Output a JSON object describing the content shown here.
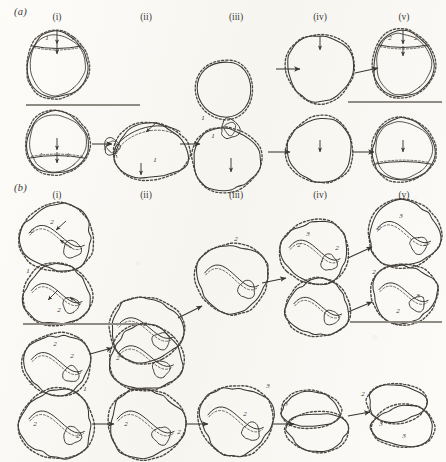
{
  "figure": {
    "background_color": "#fbfaf7",
    "ink_color": "#3a3733",
    "panels": [
      {
        "id": "a",
        "label": "(a)",
        "label_x": 14,
        "label_y": 10
      },
      {
        "id": "b",
        "label": "(b)",
        "label_x": 14,
        "label_y": 186
      }
    ],
    "column_headers": [
      {
        "label": "(i)",
        "x": 57,
        "y_a": 12,
        "y_b": 190
      },
      {
        "label": "(ii)",
        "x": 146,
        "y_a": 12,
        "y_b": 190
      },
      {
        "label": "(iii)",
        "x": 236,
        "y_a": 12,
        "y_b": 190
      },
      {
        "label": "(iv)",
        "x": 320,
        "y_a": 12,
        "y_b": 190
      },
      {
        "label": "(v)",
        "x": 404,
        "y_a": 12,
        "y_b": 190
      }
    ],
    "scale_bars": [
      {
        "name": "scale-bar-a-left",
        "x1": 26,
        "x2": 140,
        "y": 105
      },
      {
        "name": "scale-bar-a-right",
        "x1": 348,
        "x2": 442,
        "y": 102
      },
      {
        "name": "scale-bar-b-upper-left",
        "x1": 23,
        "x2": 138,
        "y": 324
      },
      {
        "name": "scale-bar-b-upper-right",
        "x1": 350,
        "x2": 442,
        "y": 322
      }
    ],
    "segment_labels": [
      {
        "text": "1",
        "x": 47,
        "y": 38
      },
      {
        "text": "1",
        "x": 73,
        "y": 38
      },
      {
        "text": "2",
        "x": 390,
        "y": 38
      },
      {
        "text": "2",
        "x": 416,
        "y": 38
      },
      {
        "text": "1",
        "x": 203,
        "y": 118
      },
      {
        "text": "1",
        "x": 213,
        "y": 136
      },
      {
        "text": "1",
        "x": 105,
        "y": 148
      },
      {
        "text": "1",
        "x": 155,
        "y": 160
      },
      {
        "text": "1",
        "x": 41,
        "y": 155
      },
      {
        "text": "1",
        "x": 68,
        "y": 155
      },
      {
        "text": "2",
        "x": 52,
        "y": 222
      },
      {
        "text": "2",
        "x": 32,
        "y": 231
      },
      {
        "text": "1",
        "x": 28,
        "y": 271
      },
      {
        "text": "2",
        "x": 59,
        "y": 310
      },
      {
        "text": "2",
        "x": 145,
        "y": 324
      },
      {
        "text": "2",
        "x": 236,
        "y": 239
      },
      {
        "text": "3",
        "x": 308,
        "y": 234
      },
      {
        "text": "2",
        "x": 299,
        "y": 245
      },
      {
        "text": "2",
        "x": 337,
        "y": 248
      },
      {
        "text": "3",
        "x": 401,
        "y": 216
      },
      {
        "text": "2",
        "x": 379,
        "y": 228
      },
      {
        "text": "2",
        "x": 425,
        "y": 244
      },
      {
        "text": "2",
        "x": 374,
        "y": 272
      },
      {
        "text": "3",
        "x": 418,
        "y": 296
      },
      {
        "text": "2",
        "x": 398,
        "y": 311
      },
      {
        "text": "2",
        "x": 55,
        "y": 344
      },
      {
        "text": "2",
        "x": 72,
        "y": 356
      },
      {
        "text": "1",
        "x": 31,
        "y": 383
      },
      {
        "text": "1",
        "x": 85,
        "y": 389
      },
      {
        "text": "2",
        "x": 35,
        "y": 424
      },
      {
        "text": "2",
        "x": 78,
        "y": 436
      },
      {
        "text": "2",
        "x": 118,
        "y": 358
      },
      {
        "text": "2",
        "x": 126,
        "y": 424
      },
      {
        "text": "2",
        "x": 179,
        "y": 432
      },
      {
        "text": "2",
        "x": 245,
        "y": 414
      },
      {
        "text": "3",
        "x": 286,
        "y": 404
      },
      {
        "text": "3",
        "x": 268,
        "y": 386
      },
      {
        "text": "3",
        "x": 381,
        "y": 424
      },
      {
        "text": "3",
        "x": 404,
        "y": 436
      },
      {
        "text": "2",
        "x": 363,
        "y": 394
      }
    ],
    "transition_arrows": [
      {
        "name": "arrow-a-top-iii-to-iv",
        "x1": 276,
        "y1": 69,
        "x2": 300,
        "y2": 69
      },
      {
        "name": "arrow-a-top-iv-to-v",
        "x1": 355,
        "y1": 73,
        "x2": 378,
        "y2": 68
      },
      {
        "name": "arrow-a-bot-i-to-ii",
        "x1": 92,
        "y1": 144,
        "x2": 112,
        "y2": 144
      },
      {
        "name": "arrow-a-bot-ii-to-iii",
        "x1": 180,
        "y1": 144,
        "x2": 200,
        "y2": 144
      },
      {
        "name": "arrow-a-bot-iii-to-iv",
        "x1": 268,
        "y1": 152,
        "x2": 290,
        "y2": 152
      },
      {
        "name": "arrow-a-bot-iv-to-v",
        "x1": 352,
        "y1": 152,
        "x2": 374,
        "y2": 152
      },
      {
        "name": "arrow-b-top-ii-to-iii",
        "x1": 178,
        "y1": 318,
        "x2": 202,
        "y2": 306
      },
      {
        "name": "arrow-b-top-iii-to-iv",
        "x1": 262,
        "y1": 283,
        "x2": 286,
        "y2": 278
      },
      {
        "name": "arrow-b-top-iv-to-v",
        "x1": 348,
        "y1": 258,
        "x2": 372,
        "y2": 247
      },
      {
        "name": "arrow-b-mid-iv-to-v",
        "x1": 348,
        "y1": 312,
        "x2": 372,
        "y2": 302
      },
      {
        "name": "arrow-b-bot-i-to-ii",
        "x1": 90,
        "y1": 354,
        "x2": 112,
        "y2": 348
      },
      {
        "name": "arrow-b-bot2-i-to-ii",
        "x1": 92,
        "y1": 424,
        "x2": 114,
        "y2": 424
      },
      {
        "name": "arrow-b-bot2-ii-to-iii",
        "x1": 186,
        "y1": 424,
        "x2": 208,
        "y2": 424
      },
      {
        "name": "arrow-b-bot2-iii-to-iv",
        "x1": 272,
        "y1": 424,
        "x2": 294,
        "y2": 424
      },
      {
        "name": "arrow-b-bot2-iv-to-v",
        "x1": 348,
        "y1": 416,
        "x2": 370,
        "y2": 412
      }
    ],
    "feature_arrows": [
      {
        "name": "feature-arrow",
        "x1": 57,
        "y1": 30,
        "x2": 57,
        "y2": 44
      },
      {
        "name": "feature-arrow",
        "x1": 57,
        "y1": 44,
        "x2": 57,
        "y2": 54
      },
      {
        "name": "feature-arrow",
        "x1": 320,
        "y1": 36,
        "x2": 320,
        "y2": 50
      },
      {
        "name": "feature-arrow",
        "x1": 403,
        "y1": 30,
        "x2": 403,
        "y2": 44
      },
      {
        "name": "feature-arrow",
        "x1": 403,
        "y1": 46,
        "x2": 403,
        "y2": 56
      },
      {
        "name": "feature-arrow",
        "x1": 57,
        "y1": 138,
        "x2": 57,
        "y2": 150
      },
      {
        "name": "feature-arrow",
        "x1": 57,
        "y1": 152,
        "x2": 57,
        "y2": 163
      },
      {
        "name": "feature-arrow",
        "x1": 141,
        "y1": 163,
        "x2": 141,
        "y2": 175
      },
      {
        "name": "feature-arrow",
        "x1": 231,
        "y1": 158,
        "x2": 231,
        "y2": 172
      },
      {
        "name": "feature-arrow",
        "x1": 320,
        "y1": 140,
        "x2": 320,
        "y2": 152
      },
      {
        "name": "feature-arrow",
        "x1": 403,
        "y1": 140,
        "x2": 403,
        "y2": 152
      },
      {
        "name": "feature-arrow",
        "x1": 157,
        "y1": 122,
        "x2": 146,
        "y2": 132
      },
      {
        "name": "feature-arrow",
        "x1": 66,
        "y1": 221,
        "x2": 56,
        "y2": 230
      },
      {
        "name": "feature-arrow",
        "x1": 72,
        "y1": 248,
        "x2": 60,
        "y2": 240
      },
      {
        "name": "feature-arrow",
        "x1": 58,
        "y1": 290,
        "x2": 48,
        "y2": 300
      },
      {
        "name": "feature-arrow",
        "x1": 80,
        "y1": 305,
        "x2": 70,
        "y2": 297
      }
    ],
    "shapes": [
      {
        "name": "loop-a-i-top",
        "type": "circle-with-cap",
        "cx": 57,
        "cy": 65,
        "rx": 30,
        "ry": 33,
        "cap_y": 46,
        "double_track": true
      },
      {
        "name": "loop-a-i-bottom",
        "type": "circle-with-cap",
        "cx": 57,
        "cy": 143,
        "rx": 31,
        "ry": 31,
        "cap_y": 158,
        "cap_down": true,
        "double_track": true
      },
      {
        "name": "loop-a-ii-bottom",
        "type": "twisted-double-loop",
        "cx": 146,
        "cy": 148,
        "rx": 40,
        "ry": 30
      },
      {
        "name": "loop-a-iii",
        "type": "supercoil-lollipop",
        "cx": 228,
        "cy": 110,
        "rx": 34,
        "ry": 52
      },
      {
        "name": "loop-a-iv-top",
        "type": "circle-plain",
        "cx": 320,
        "cy": 68,
        "rx": 33,
        "ry": 33
      },
      {
        "name": "loop-a-iv-bottom",
        "type": "circle-plain",
        "cx": 320,
        "cy": 150,
        "rx": 32,
        "ry": 32
      },
      {
        "name": "loop-a-v-top",
        "type": "circle-with-cap",
        "cx": 403,
        "cy": 64,
        "rx": 30,
        "ry": 33,
        "cap_y": 45,
        "double_track": true
      },
      {
        "name": "loop-a-v-bottom",
        "type": "circle-with-cap",
        "cx": 403,
        "cy": 150,
        "rx": 31,
        "ry": 31,
        "cap_y": 164,
        "cap_down": true,
        "double_track": true
      },
      {
        "name": "loop-b-i-upper",
        "type": "lobed-loop",
        "cx": 57,
        "cy": 238,
        "rx": 36,
        "ry": 33
      },
      {
        "name": "loop-b-i-lower",
        "type": "lobed-loop",
        "cx": 57,
        "cy": 295,
        "rx": 33,
        "ry": 30
      },
      {
        "name": "loop-b-ii-upper",
        "type": "lobed-loop",
        "cx": 146,
        "cy": 330,
        "rx": 36,
        "ry": 32
      },
      {
        "name": "loop-b-iii-mid",
        "type": "lobed-loop",
        "cx": 232,
        "cy": 278,
        "rx": 35,
        "ry": 34
      },
      {
        "name": "loop-b-iv-upper",
        "type": "lobed-loop",
        "cx": 315,
        "cy": 252,
        "rx": 33,
        "ry": 31
      },
      {
        "name": "loop-b-iv-lower",
        "type": "lobed-loop",
        "cx": 318,
        "cy": 308,
        "rx": 31,
        "ry": 28
      },
      {
        "name": "loop-b-v-upper",
        "type": "lobed-loop",
        "cx": 404,
        "cy": 234,
        "rx": 35,
        "ry": 33
      },
      {
        "name": "loop-b-v-lower",
        "type": "lobed-loop",
        "cx": 404,
        "cy": 294,
        "rx": 32,
        "ry": 29
      },
      {
        "name": "loop-b-bot-i-upper",
        "type": "lobed-loop",
        "cx": 57,
        "cy": 364,
        "rx": 33,
        "ry": 30
      },
      {
        "name": "loop-b-bot-i-lower",
        "type": "lobed-loop",
        "cx": 57,
        "cy": 424,
        "rx": 36,
        "ry": 34
      },
      {
        "name": "loop-b-bot-ii-upper",
        "type": "lobed-loop",
        "cx": 146,
        "cy": 358,
        "rx": 36,
        "ry": 32
      },
      {
        "name": "loop-b-bot-ii-lower",
        "type": "lobed-loop",
        "cx": 146,
        "cy": 424,
        "rx": 37,
        "ry": 34
      },
      {
        "name": "loop-b-bot-iii",
        "type": "lobed-loop",
        "cx": 236,
        "cy": 420,
        "rx": 36,
        "ry": 34
      },
      {
        "name": "loop-b-bot-iv",
        "type": "figure-eight",
        "cx": 314,
        "cy": 420,
        "rx": 36,
        "ry": 34
      },
      {
        "name": "loop-b-bot-v",
        "type": "figure-eight",
        "cx": 400,
        "cy": 414,
        "rx": 36,
        "ry": 36
      }
    ]
  }
}
